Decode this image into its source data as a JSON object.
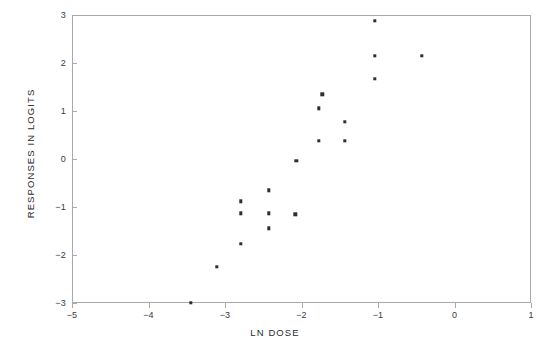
{
  "page": {
    "header_text": ""
  },
  "chart_data": {
    "type": "scatter",
    "title": "",
    "xlabel": "LN DOSE",
    "ylabel": "RESPONSES IN LOGITS",
    "xlim": [
      -5,
      1
    ],
    "ylim": [
      -3,
      3
    ],
    "xticks": [
      -5,
      -4,
      -3,
      -2,
      -1,
      0,
      1
    ],
    "xtick_labels": [
      "−5",
      "−4",
      "−3",
      "−2",
      "−1",
      "0",
      "1"
    ],
    "yticks": [
      -3,
      -2,
      -1,
      0,
      1,
      2,
      3
    ],
    "ytick_labels": [
      "−3",
      "−2",
      "−1",
      "0",
      "1",
      "2",
      "3"
    ],
    "grid": false,
    "legend": false,
    "marker": "square",
    "marker_color": "#2f2f33",
    "frame_color": "#a8aab0",
    "background": "#ffffff",
    "points": [
      {
        "x": -3.45,
        "y": -3.0
      },
      {
        "x": -3.11,
        "y": -2.25
      },
      {
        "x": -2.79,
        "y": -1.77
      },
      {
        "x": -2.79,
        "y": -1.13
      },
      {
        "x": -2.79,
        "y": -0.88
      },
      {
        "x": -2.43,
        "y": -0.65
      },
      {
        "x": -2.43,
        "y": -1.13
      },
      {
        "x": -2.43,
        "y": -1.44
      },
      {
        "x": -2.08,
        "y": -1.15
      },
      {
        "x": -2.07,
        "y": -0.04
      },
      {
        "x": -1.77,
        "y": 0.38
      },
      {
        "x": -1.77,
        "y": 1.06
      },
      {
        "x": -1.73,
        "y": 1.35
      },
      {
        "x": -1.43,
        "y": 0.38
      },
      {
        "x": -1.43,
        "y": 0.77
      },
      {
        "x": -1.04,
        "y": 1.67
      },
      {
        "x": -1.04,
        "y": 2.15
      },
      {
        "x": -1.04,
        "y": 2.88
      },
      {
        "x": -0.43,
        "y": 2.15
      }
    ]
  }
}
